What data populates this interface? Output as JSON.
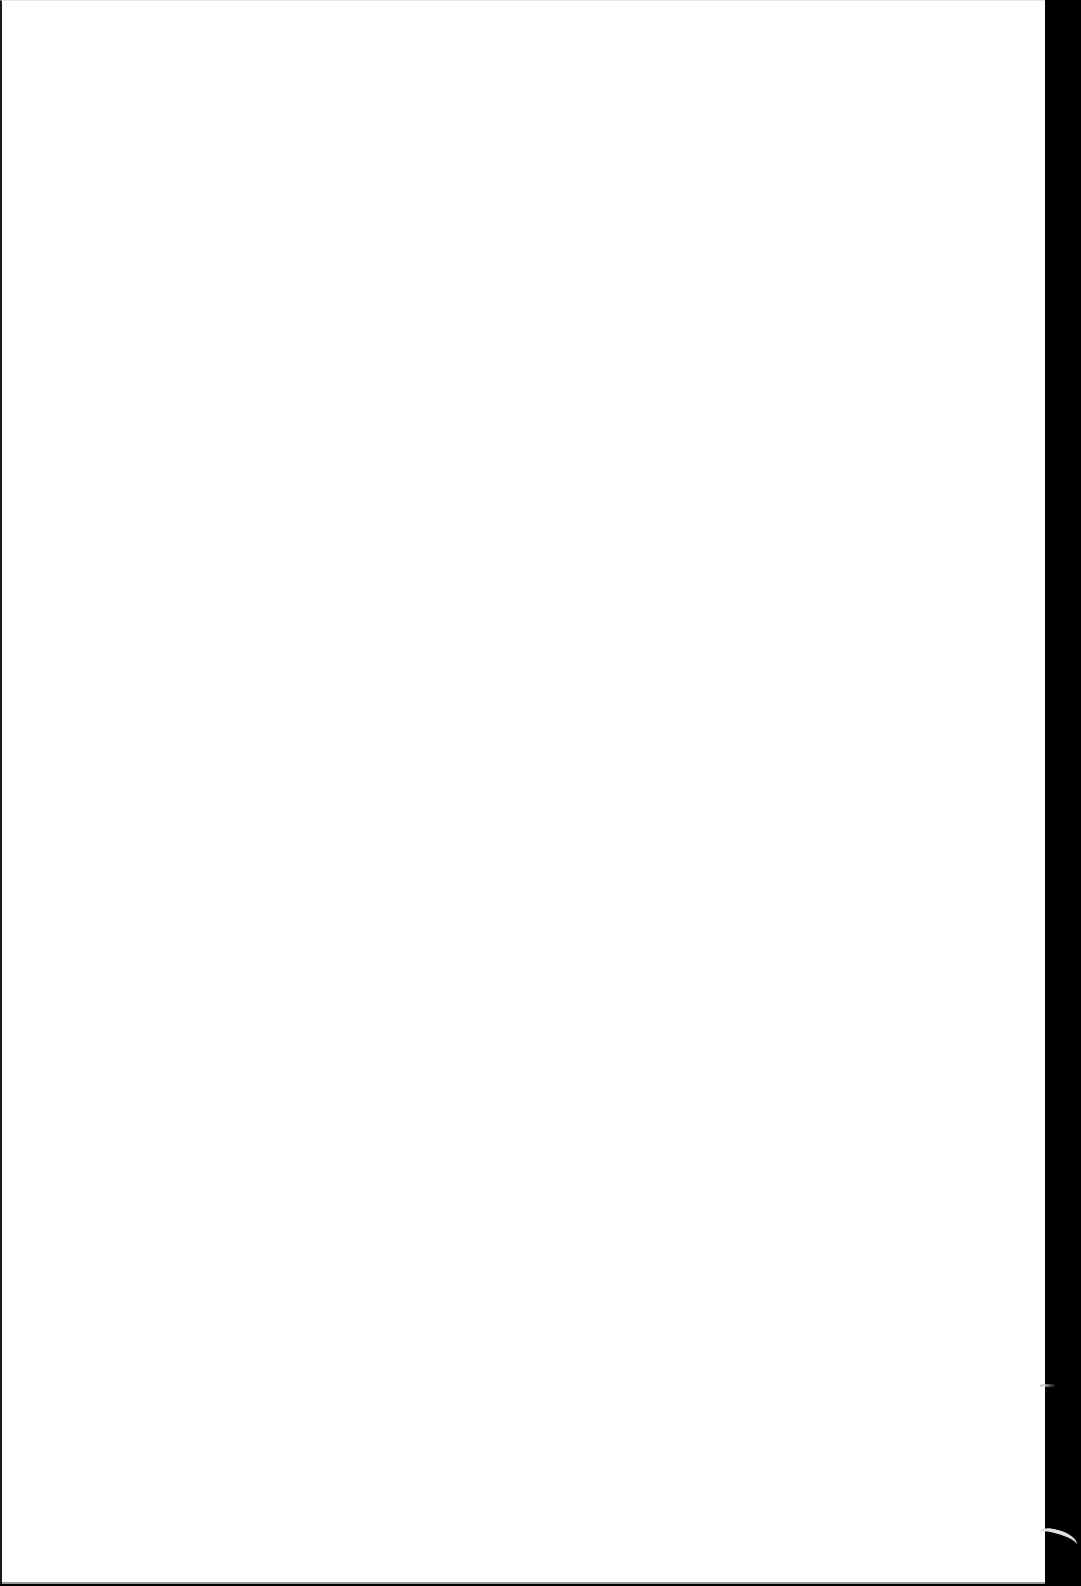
{
  "document": {
    "type": "scanned-page",
    "content": "blank",
    "page_color": "#ffffff",
    "background_color": "#000000"
  }
}
